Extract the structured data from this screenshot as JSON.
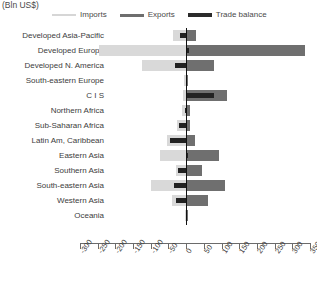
{
  "chart_data": {
    "type": "bar",
    "orientation": "horizontal",
    "title": "(Bln US$)",
    "xlabel": "",
    "ylabel": "",
    "xlim": [
      -300,
      350
    ],
    "xticks": [
      -300,
      -250,
      -200,
      -150,
      -100,
      -50,
      0,
      50,
      100,
      150,
      200,
      250,
      300,
      350
    ],
    "grid": false,
    "legend_position": "top",
    "categories": [
      "Developed Asia-Pacific",
      "Developed Europe",
      "Developed N. America",
      "South-eastern Europe",
      "C I S",
      "Northern Africa",
      "Sub-Saharan Africa",
      "Latin Am, Caribbean",
      "Eastern Asia",
      "Southern Asia",
      "South-eastern Asia",
      "Western Asia",
      "Oceania"
    ],
    "series": [
      {
        "name": "Imports",
        "color": "#d9d9d9",
        "values": [
          -38,
          -245,
          -125,
          -5,
          -8,
          -12,
          -25,
          -55,
          -75,
          -30,
          -100,
          -40,
          -3
        ]
      },
      {
        "name": "Exports",
        "color": "#6f6f6f",
        "values": [
          28,
          335,
          78,
          5,
          115,
          10,
          12,
          25,
          92,
          45,
          110,
          62,
          4
        ]
      },
      {
        "name": "Trade balance",
        "color": "#222222",
        "values": [
          -18,
          8,
          -32,
          2,
          80,
          -3,
          -20,
          -45,
          5,
          -22,
          -35,
          -28,
          1
        ]
      }
    ]
  },
  "legend": {
    "items": [
      {
        "label": "Imports",
        "key": "imports"
      },
      {
        "label": "Exports",
        "key": "exports"
      },
      {
        "label": "Trade balance",
        "key": "balance"
      }
    ]
  },
  "colors": {
    "imports": "#d9d9d9",
    "exports": "#6f6f6f",
    "balance": "#222222",
    "axis": "#6b6b6b",
    "text": "#3d3d3d"
  }
}
